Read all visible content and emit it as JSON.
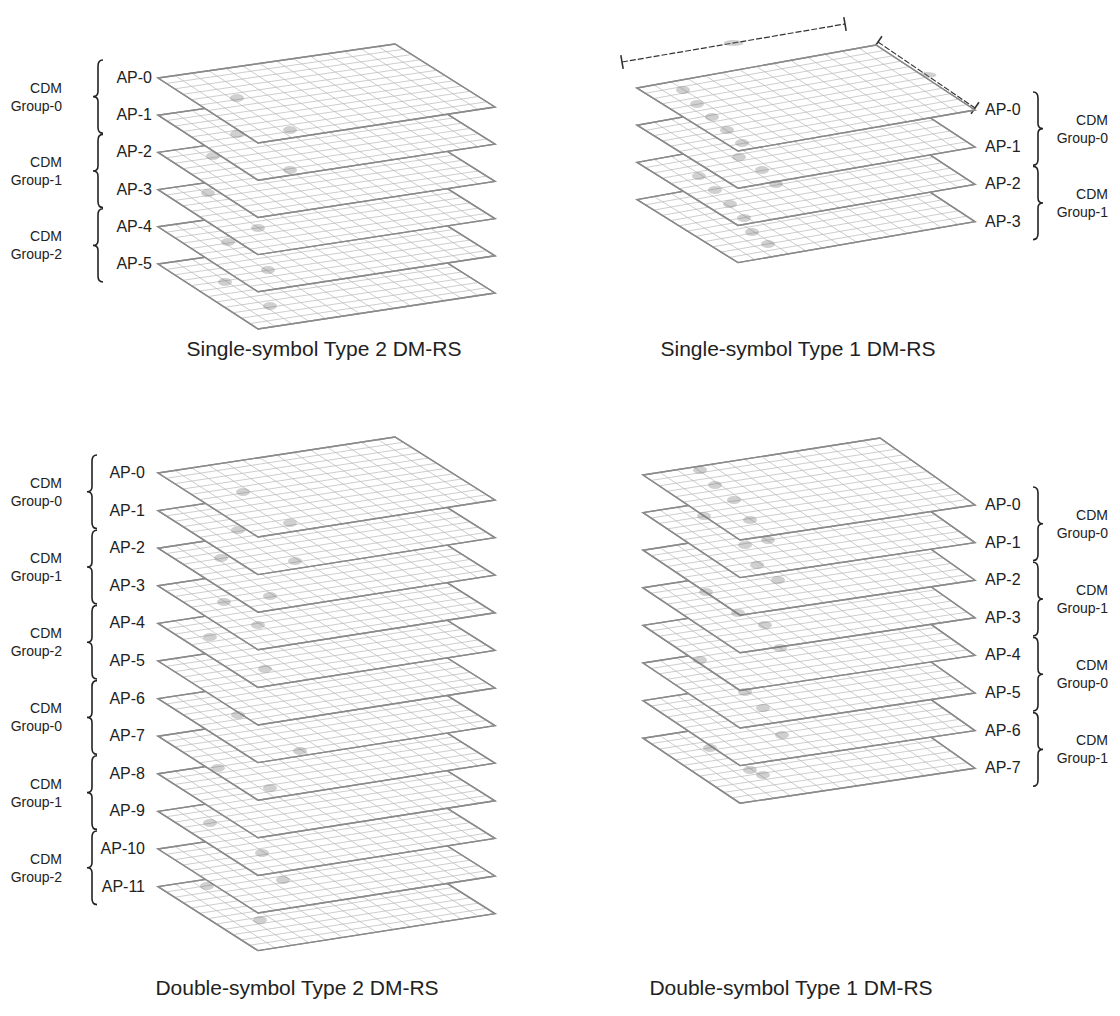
{
  "figure": {
    "panels": [
      {
        "id": "single-type2",
        "caption": "Single-symbol Type 2 DM-RS",
        "caption_pos": [
          324,
          356
        ],
        "label_side": "left",
        "plane": {
          "left": [
            158,
            78
          ],
          "top": [
            395,
            44
          ],
          "right": [
            495,
            107
          ],
          "bottom": [
            258,
            143
          ]
        },
        "step": 37.2,
        "cols": 14,
        "rows": 12,
        "ports": [
          "AP-0",
          "AP-1",
          "AP-2",
          "AP-3",
          "AP-4",
          "AP-5"
        ],
        "ap_label_x": 152,
        "brace_x": 98,
        "group_label_x": 62,
        "groups": [
          {
            "line1": "CDM",
            "line2": "Group-0",
            "ports": [
              0,
              1
            ]
          },
          {
            "line1": "CDM",
            "line2": "Group-1",
            "ports": [
              2,
              3
            ]
          },
          {
            "line1": "CDM",
            "line2": "Group-2",
            "ports": [
              4,
              5
            ]
          }
        ],
        "smudges": [
          [
            237,
            98
          ],
          [
            237,
            134
          ],
          [
            290,
            130
          ],
          [
            213,
            156
          ],
          [
            290,
            170
          ],
          [
            208,
            193
          ],
          [
            258,
            228
          ],
          [
            228,
            242
          ],
          [
            268,
            270
          ],
          [
            225,
            282
          ],
          [
            270,
            306
          ]
        ]
      },
      {
        "id": "single-type1",
        "caption": "Single-symbol Type 1 DM-RS",
        "caption_pos": [
          798,
          356
        ],
        "label_side": "right",
        "plane": {
          "left": [
            637,
            88
          ],
          "top": [
            876,
            45
          ],
          "right": [
            975,
            110
          ],
          "bottom": [
            738,
            151
          ]
        },
        "step": 37.2,
        "cols": 14,
        "rows": 12,
        "ports": [
          "AP-0",
          "AP-1",
          "AP-2",
          "AP-3"
        ],
        "ap_label_x": 985,
        "brace_x": 1038,
        "group_label_x": 1108,
        "groups": [
          {
            "line1": "CDM",
            "line2": "Group-0",
            "ports": [
              0,
              1
            ]
          },
          {
            "line1": "CDM",
            "line2": "Group-1",
            "ports": [
              2,
              3
            ]
          }
        ],
        "dimensions": {
          "long": {
            "from": [
              622,
              62
            ],
            "to": [
              845,
              24
            ],
            "label": ""
          },
          "short": {
            "from": [
              878,
              42
            ],
            "to": [
              975,
              108
            ],
            "label": ""
          }
        },
        "smudges": [
          [
            683,
            90
          ],
          [
            697,
            104
          ],
          [
            712,
            117
          ],
          [
            727,
            130
          ],
          [
            742,
            143
          ],
          [
            739,
            157
          ],
          [
            762,
            170
          ],
          [
            776,
            184
          ],
          [
            699,
            176
          ],
          [
            715,
            190
          ],
          [
            730,
            204
          ],
          [
            744,
            218
          ],
          [
            752,
            232
          ],
          [
            768,
            244
          ]
        ]
      },
      {
        "id": "double-type2",
        "caption": "Double-symbol Type 2 DM-RS",
        "caption_pos": [
          297,
          995
        ],
        "label_side": "left",
        "plane": {
          "left": [
            158,
            473
          ],
          "top": [
            395,
            437
          ],
          "right": [
            495,
            500
          ],
          "bottom": [
            258,
            537
          ]
        },
        "step": 37.6,
        "cols": 14,
        "rows": 12,
        "ports": [
          "AP-0",
          "AP-1",
          "AP-2",
          "AP-3",
          "AP-4",
          "AP-5",
          "AP-6",
          "AP-7",
          "AP-8",
          "AP-9",
          "AP-10",
          "AP-11"
        ],
        "ap_label_x": 145,
        "brace_x": 92,
        "group_label_x": 62,
        "groups": [
          {
            "line1": "CDM",
            "line2": "Group-0",
            "ports": [
              0,
              1
            ]
          },
          {
            "line1": "CDM",
            "line2": "Group-1",
            "ports": [
              2,
              3
            ]
          },
          {
            "line1": "CDM",
            "line2": "Group-2",
            "ports": [
              4,
              5
            ]
          },
          {
            "line1": "CDM",
            "line2": "Group-0",
            "ports": [
              6,
              7
            ]
          },
          {
            "line1": "CDM",
            "line2": "Group-1",
            "ports": [
              8,
              9
            ]
          },
          {
            "line1": "CDM",
            "line2": "Group-2",
            "ports": [
              10,
              11
            ]
          }
        ],
        "smudges": [
          [
            243,
            492
          ],
          [
            238,
            530
          ],
          [
            290,
            523
          ],
          [
            295,
            561
          ],
          [
            221,
            558
          ],
          [
            270,
            596
          ],
          [
            224,
            602
          ],
          [
            258,
            625
          ],
          [
            210,
            637
          ],
          [
            265,
            669
          ],
          [
            238,
            715
          ],
          [
            300,
            751
          ],
          [
            218,
            768
          ],
          [
            270,
            788
          ],
          [
            210,
            823
          ],
          [
            262,
            853
          ],
          [
            283,
            880
          ],
          [
            207,
            886
          ],
          [
            260,
            920
          ]
        ]
      },
      {
        "id": "double-type1",
        "caption": "Double-symbol Type 1 DM-RS",
        "caption_pos": [
          791,
          995
        ],
        "label_side": "right",
        "plane": {
          "left": [
            643,
            475
          ],
          "top": [
            880,
            438
          ],
          "right": [
            975,
            505
          ],
          "bottom": [
            740,
            540
          ]
        },
        "step": 37.6,
        "cols": 14,
        "rows": 12,
        "ports": [
          "AP-0",
          "AP-1",
          "AP-2",
          "AP-3",
          "AP-4",
          "AP-5",
          "AP-6",
          "AP-7"
        ],
        "ap_label_x": 985,
        "brace_x": 1038,
        "group_label_x": 1108,
        "groups": [
          {
            "line1": "CDM",
            "line2": "Group-0",
            "ports": [
              0,
              1
            ]
          },
          {
            "line1": "CDM",
            "line2": "Group-1",
            "ports": [
              2,
              3
            ]
          },
          {
            "line1": "CDM",
            "line2": "Group-0",
            "ports": [
              4,
              5
            ]
          },
          {
            "line1": "CDM",
            "line2": "Group-1",
            "ports": [
              6,
              7
            ]
          }
        ],
        "smudges": [
          [
            700,
            470
          ],
          [
            715,
            485
          ],
          [
            734,
            500
          ],
          [
            750,
            520
          ],
          [
            768,
            540
          ],
          [
            704,
            516
          ],
          [
            745,
            545
          ],
          [
            757,
            565
          ],
          [
            778,
            580
          ],
          [
            706,
            592
          ],
          [
            738,
            613
          ],
          [
            765,
            625
          ],
          [
            780,
            648
          ],
          [
            700,
            660
          ],
          [
            745,
            692
          ],
          [
            763,
            708
          ],
          [
            782,
            735
          ],
          [
            710,
            748
          ],
          [
            750,
            770
          ],
          [
            763,
            775
          ]
        ]
      }
    ]
  }
}
